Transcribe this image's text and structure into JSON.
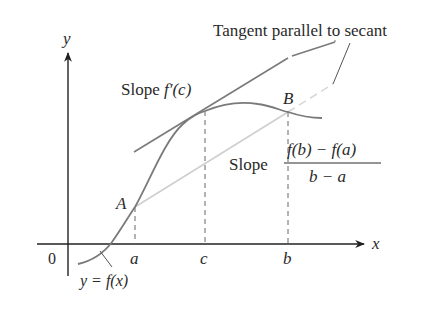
{
  "diagram": {
    "axes": {
      "x_label": "x",
      "y_label": "y",
      "origin_label": "0",
      "ticks": [
        {
          "label": "a",
          "x": 135
        },
        {
          "label": "c",
          "x": 205
        },
        {
          "label": "b",
          "x": 288
        }
      ]
    },
    "points": {
      "A": {
        "label": "A"
      },
      "B": {
        "label": "B"
      }
    },
    "curve_label": "y = f(x)",
    "tangent_label": {
      "prefix": "Slope ",
      "expr": "f′(c)"
    },
    "secant_label": {
      "prefix": "Slope",
      "numerator": "f(b) − f(a)",
      "denominator": "b − a"
    },
    "callout": "Tangent parallel to secant",
    "colors": {
      "axis": "#222222",
      "curve": "#7a7a7a",
      "tangent": "#7a7a7a",
      "secant": "#cfcfcf",
      "text": "#2a2a2a",
      "dashed": "#666666"
    }
  }
}
